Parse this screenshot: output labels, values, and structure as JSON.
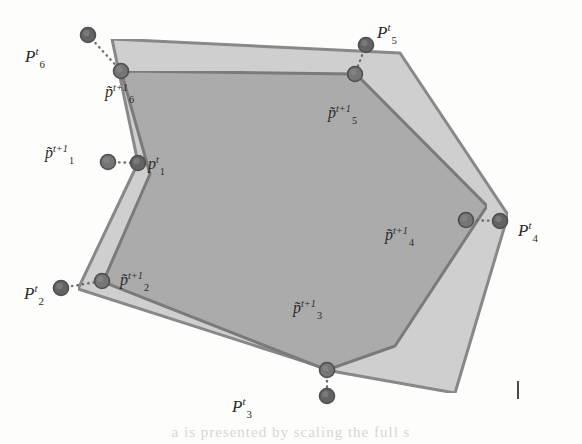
{
  "figure": {
    "background_color": "#fdfdfc",
    "tickmark": {
      "x": 517,
      "y": 381,
      "color": "#4a4a4a"
    },
    "bleed_text": "a  is  presented  by  scaling  the  full  s"
  },
  "chart_data": {
    "type": "diagram",
    "polygons": [
      {
        "name": "P_t",
        "label": "P^t",
        "fill": "#c9c9c9",
        "fill_opacity": 0.85,
        "stroke": "#8a8a8a",
        "stroke_width": 3,
        "vertices": [
          {
            "id": "P_t_6",
            "x": 112,
            "y": 39
          },
          {
            "id": "P_t_5",
            "x": 400,
            "y": 53
          },
          {
            "id": "P_t_4_upper",
            "x": 508,
            "y": 215
          },
          {
            "id": "P_t_bottom_right",
            "x": 455,
            "y": 393
          },
          {
            "id": "P_t_3",
            "x": 337,
            "y": 372
          },
          {
            "id": "P_t_2",
            "x": 78,
            "y": 289
          },
          {
            "id": "P_t_1",
            "x": 138,
            "y": 163
          }
        ]
      },
      {
        "name": "P_tilde_t1",
        "label": "p~^(t+1)",
        "fill": "#a8a8a8",
        "fill_opacity": 0.9,
        "stroke": "#7c7c7c",
        "stroke_width": 3,
        "vertices": [
          {
            "id": "pt1_6",
            "x": 121,
            "y": 71
          },
          {
            "id": "pt1_5",
            "x": 356,
            "y": 74
          },
          {
            "id": "pt1_4",
            "x": 487,
            "y": 206
          },
          {
            "id": "pt1_3_right",
            "x": 395,
            "y": 346
          },
          {
            "id": "pt1_3",
            "x": 327,
            "y": 370
          },
          {
            "id": "pt1_2",
            "x": 103,
            "y": 282
          },
          {
            "id": "pt1_1",
            "x": 150,
            "y": 174
          }
        ]
      }
    ],
    "points": [
      {
        "id": "P_t_1",
        "label_key": "p_t_1",
        "x": 138,
        "y": 163,
        "color": "#636363"
      },
      {
        "id": "P_t_2",
        "label_key": "p_t_2",
        "x": 61,
        "y": 288,
        "color": "#636363"
      },
      {
        "id": "P_t_3",
        "label_key": "p_t_3",
        "x": 327,
        "y": 396,
        "color": "#636363"
      },
      {
        "id": "P_t_4",
        "label_key": "p_t_4",
        "x": 500,
        "y": 221,
        "color": "#636363"
      },
      {
        "id": "P_t_5",
        "label_key": "p_t_5",
        "x": 366,
        "y": 45,
        "color": "#636363"
      },
      {
        "id": "P_t_6",
        "label_key": "p_t_6",
        "x": 88,
        "y": 35,
        "color": "#636363"
      },
      {
        "id": "pt1_1",
        "label_key": "p_tilde_1",
        "x": 108,
        "y": 162,
        "color": "#757575"
      },
      {
        "id": "pt1_2",
        "label_key": "p_tilde_2",
        "x": 102,
        "y": 281,
        "color": "#757575"
      },
      {
        "id": "pt1_3",
        "label_key": "p_tilde_3",
        "x": 327,
        "y": 370,
        "color": "#757575"
      },
      {
        "id": "pt1_4",
        "label_key": "p_tilde_4",
        "x": 466,
        "y": 220,
        "color": "#757575"
      },
      {
        "id": "pt1_5",
        "label_key": "p_tilde_5",
        "x": 355,
        "y": 74,
        "color": "#757575"
      },
      {
        "id": "pt1_6",
        "label_key": "p_tilde_6",
        "x": 121,
        "y": 71,
        "color": "#757575"
      }
    ],
    "correspondence_lines": [
      {
        "from": "P_t_6",
        "to": "pt1_6",
        "x1": 88,
        "y1": 35,
        "x2": 121,
        "y2": 71
      },
      {
        "from": "pt1_1",
        "to": "P_t_1",
        "x1": 108,
        "y1": 162,
        "x2": 138,
        "y2": 163
      },
      {
        "from": "P_t_2",
        "to": "pt1_2",
        "x1": 61,
        "y1": 288,
        "x2": 102,
        "y2": 281
      },
      {
        "from": "pt1_3",
        "to": "P_t_3",
        "x1": 327,
        "y1": 370,
        "x2": 327,
        "y2": 396
      },
      {
        "from": "pt1_4",
        "to": "P_t_4",
        "x1": 466,
        "y1": 220,
        "x2": 500,
        "y2": 221
      },
      {
        "from": "P_t_5",
        "to": "pt1_5",
        "x1": 366,
        "y1": 45,
        "x2": 355,
        "y2": 74
      }
    ],
    "dot_radius": 7.5,
    "line_style": "dotted"
  },
  "labels": {
    "p_t_1": {
      "base": "p",
      "sup": "t",
      "sub": "1",
      "x": 148,
      "y": 156,
      "size": 16
    },
    "p_t_2": {
      "base": "P",
      "sup": "t",
      "sub": "2",
      "x": 24,
      "y": 285,
      "size": 17
    },
    "p_t_3": {
      "base": "P",
      "sup": "t",
      "sub": "3",
      "x": 232,
      "y": 398,
      "size": 17
    },
    "p_t_4": {
      "base": "P",
      "sup": "t",
      "sub": "4",
      "x": 518,
      "y": 222,
      "size": 17
    },
    "p_t_5": {
      "base": "P",
      "sup": "t",
      "sub": "5",
      "x": 377,
      "y": 24,
      "size": 17
    },
    "p_t_6": {
      "base": "P",
      "sup": "t",
      "sub": "6",
      "x": 25,
      "y": 48,
      "size": 17
    },
    "p_tilde_1": {
      "base": "p̃",
      "sup": "t+1",
      "sub": "1",
      "x": 45,
      "y": 145,
      "size": 16
    },
    "p_tilde_2": {
      "base": "p̃",
      "sup": "t+1",
      "sub": "2",
      "x": 120,
      "y": 272,
      "size": 16
    },
    "p_tilde_3": {
      "base": "p̃",
      "sup": "t+1",
      "sub": "3",
      "x": 293,
      "y": 300,
      "size": 16
    },
    "p_tilde_4": {
      "base": "p̃",
      "sup": "t+1",
      "sub": "4",
      "x": 385,
      "y": 227,
      "size": 16
    },
    "p_tilde_5": {
      "base": "p̃",
      "sup": "t+1",
      "sub": "5",
      "x": 328,
      "y": 105,
      "size": 16
    },
    "p_tilde_6": {
      "base": "p̃",
      "sup": "t+1",
      "sub": "6",
      "x": 105,
      "y": 84,
      "size": 16
    }
  }
}
